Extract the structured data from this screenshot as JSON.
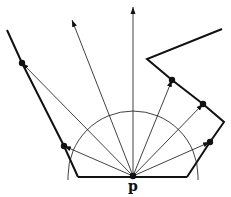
{
  "figure": {
    "point_label": "p",
    "colors": {
      "stroke": "#111111",
      "background": "#ffffff"
    },
    "origin": [
      133,
      176
    ],
    "polygon_left": [
      [
        7,
        30
      ],
      [
        22,
        63
      ],
      [
        64,
        146
      ],
      [
        78,
        177
      ]
    ],
    "polygon_bottom": [
      [
        78,
        177
      ],
      [
        187,
        177
      ]
    ],
    "polygon_right": [
      [
        187,
        177
      ],
      [
        210,
        142
      ],
      [
        224,
        122
      ],
      [
        203,
        104
      ],
      [
        172,
        80
      ],
      [
        147,
        59
      ],
      [
        222,
        29
      ]
    ],
    "semicircle_radius": 65,
    "rays": [
      [
        22,
        63
      ],
      [
        72,
        20
      ],
      [
        133,
        7
      ],
      [
        64,
        146
      ],
      [
        172,
        80
      ],
      [
        203,
        104
      ],
      [
        210,
        142
      ]
    ],
    "hit_points": [
      [
        22,
        63
      ],
      [
        64,
        146
      ],
      [
        172,
        80
      ],
      [
        203,
        104
      ],
      [
        210,
        142
      ],
      [
        133,
        176
      ]
    ]
  }
}
